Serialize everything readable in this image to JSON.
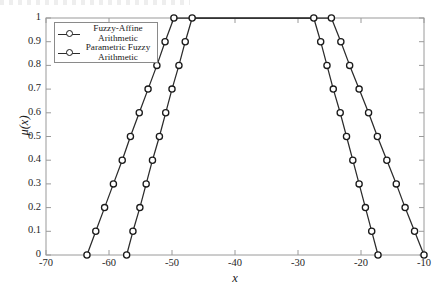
{
  "chart_data": {
    "type": "line",
    "title": "",
    "xlabel": "x",
    "ylabel": "μ(x)",
    "xlim": [
      -70,
      -10
    ],
    "ylim": [
      0,
      1
    ],
    "xticks": [
      -70,
      -60,
      -50,
      -40,
      -30,
      -20,
      -10
    ],
    "xticklabels": [
      "-70",
      "-60",
      "-50",
      "-40",
      "-30",
      "-20",
      "-10"
    ],
    "yticks": [
      0,
      0.1,
      0.2,
      0.3,
      0.4,
      0.5,
      0.6,
      0.7,
      0.8,
      0.9,
      1
    ],
    "yticklabels": [
      "0",
      "0.1",
      "0.2",
      "0.3",
      "0.4",
      "0.5",
      "0.6",
      "0.7",
      "0.8",
      "0.9",
      "1"
    ],
    "grid": false,
    "legend_position": "upper left",
    "marker": "circle",
    "line_color": "#2b2b2b",
    "marker_face_color": "#ffffff",
    "marker_edge_color": "#1a1a1a",
    "series": [
      {
        "name": "Fuzzy-Affine Arithmetic",
        "shape": "trapezoidal",
        "support": [
          -63.5,
          -10.0
        ],
        "core": [
          -49.7,
          -24.7
        ],
        "left_branch": {
          "mu": [
            0,
            0.1,
            0.2,
            0.3,
            0.4,
            0.5,
            0.6,
            0.7,
            0.8,
            0.9,
            1
          ],
          "x": [
            -63.5,
            -62.1,
            -60.7,
            -59.3,
            -57.9,
            -56.6,
            -55.2,
            -53.8,
            -52.4,
            -51.1,
            -49.7
          ]
        },
        "right_branch": {
          "mu": [
            1,
            0.9,
            0.8,
            0.7,
            0.6,
            0.5,
            0.4,
            0.3,
            0.2,
            0.1,
            0
          ],
          "x": [
            -24.7,
            -23.2,
            -21.8,
            -20.3,
            -18.8,
            -17.4,
            -15.9,
            -14.4,
            -13.0,
            -11.5,
            -10.0
          ]
        }
      },
      {
        "name": "Parametric Fuzzy Arithmetic",
        "shape": "trapezoidal",
        "support": [
          -57.2,
          -17.3
        ],
        "core": [
          -46.8,
          -27.5
        ],
        "left_branch": {
          "mu": [
            0,
            0.1,
            0.2,
            0.3,
            0.4,
            0.5,
            0.6,
            0.7,
            0.8,
            0.9,
            1
          ],
          "x": [
            -57.2,
            -56.2,
            -55.1,
            -54.1,
            -53.1,
            -52.0,
            -51.0,
            -50.0,
            -48.9,
            -47.9,
            -46.8
          ]
        },
        "right_branch": {
          "mu": [
            1,
            0.9,
            0.8,
            0.7,
            0.6,
            0.5,
            0.4,
            0.3,
            0.2,
            0.1,
            0
          ],
          "x": [
            -27.5,
            -26.4,
            -25.4,
            -24.4,
            -23.3,
            -22.3,
            -21.3,
            -20.3,
            -19.3,
            -18.3,
            -17.3
          ]
        }
      }
    ]
  },
  "legend": {
    "entries": [
      {
        "label_line1": "Fuzzy-Affine",
        "label_line2": "Arithmetic"
      },
      {
        "label_line1": "Parametric Fuzzy",
        "label_line2": "Arithmetic"
      }
    ]
  }
}
